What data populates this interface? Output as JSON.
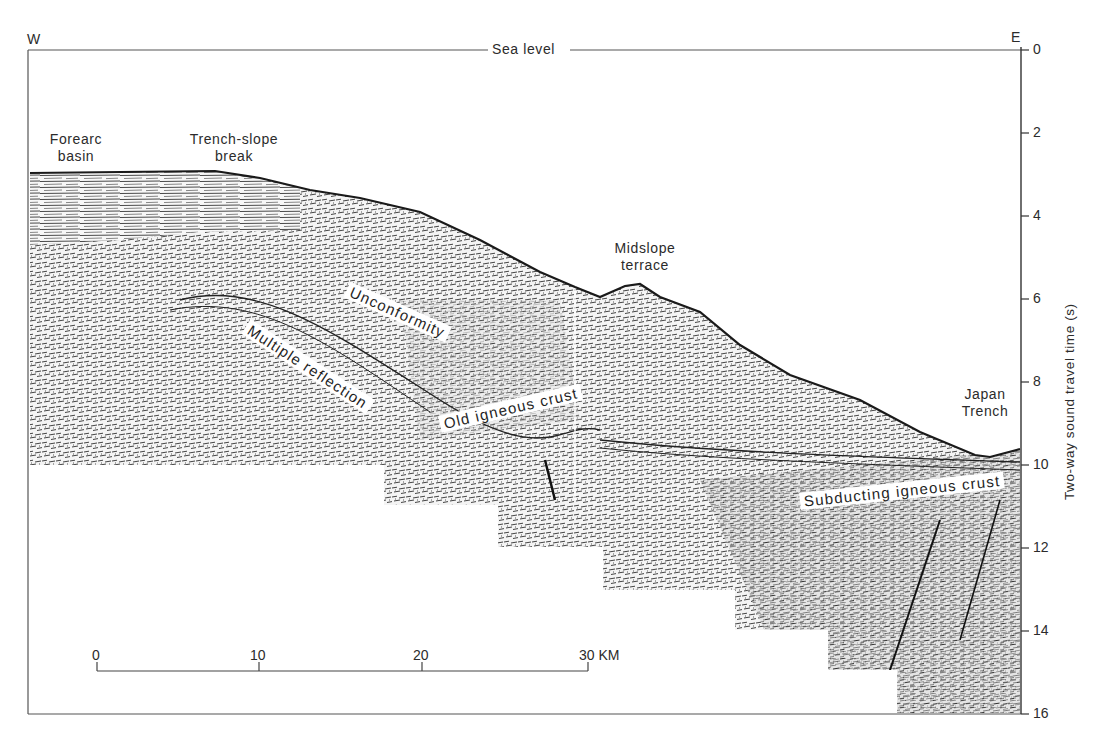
{
  "figure": {
    "orientation": {
      "west": "W",
      "east": "E"
    },
    "sea_level_label": "Sea level",
    "axis": {
      "title": "Two-way sound travel time (s)",
      "ticks": [
        "0",
        "2",
        "4",
        "6",
        "8",
        "10",
        "12",
        "14",
        "16"
      ]
    },
    "annotations": {
      "forearc_basin": [
        "Forearc",
        "basin"
      ],
      "trench_slope_break": [
        "Trench-slope",
        "break"
      ],
      "midslope_terrace": [
        "Midslope",
        "terrace"
      ],
      "japan_trench": [
        "Japan",
        "Trench"
      ],
      "unconformity": "Unconformity",
      "multiple_reflection": "Multiple reflection",
      "old_igneous_crust": "Old igneous crust",
      "subducting_igneous_crust": "Subducting igneous crust"
    },
    "scale_bar": {
      "ticks": [
        "0",
        "10",
        "20",
        "30 KM"
      ],
      "unit": "KM"
    },
    "colors": {
      "ink": "#2b2b2b",
      "background": "#ffffff",
      "seismic": "#3a3a3a"
    }
  }
}
